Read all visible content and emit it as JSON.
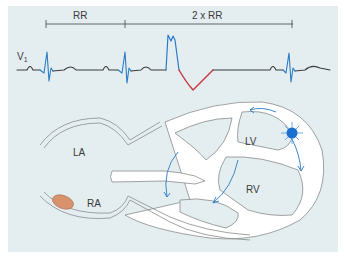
{
  "figure": {
    "ecg": {
      "lead_label": "V",
      "lead_subscript": "1",
      "interval_labels": {
        "rr": "RR",
        "double_rr": "2 x RR"
      }
    },
    "heart": {
      "chamber_labels": {
        "la": "LA",
        "ra": "RA",
        "lv": "LV",
        "rv": "RV"
      }
    },
    "colors": {
      "background_panel": "#e4eef1",
      "trace": "#3a3a3a",
      "qrs_blue": "#2a7bc4",
      "t_wave_red": "#c8323c",
      "ectopic_focus": "#1a6fd0",
      "sa_node": "#d9926e",
      "outline": "#8a8a8a"
    }
  }
}
